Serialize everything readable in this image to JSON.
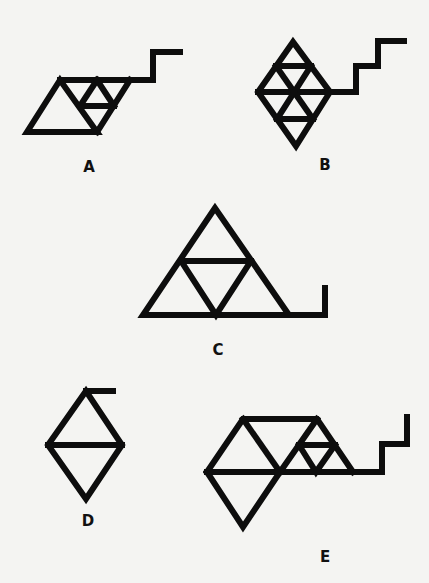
{
  "figures": [
    {
      "id": "A",
      "label": "A"
    },
    {
      "id": "B",
      "label": "B"
    },
    {
      "id": "C",
      "label": "C"
    },
    {
      "id": "D",
      "label": "D"
    },
    {
      "id": "E",
      "label": "E"
    }
  ],
  "colors": {
    "background": "#f4f4f2",
    "stroke": "#0d0d0d"
  }
}
